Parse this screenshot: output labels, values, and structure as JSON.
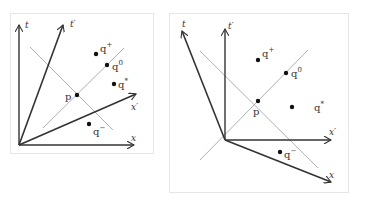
{
  "figure": {
    "panels": [
      {
        "id": "left",
        "axes": {
          "t": {
            "label": "t"
          },
          "t_prime": {
            "label": "t′"
          },
          "x": {
            "label": "x"
          },
          "x_prime": {
            "label": "x′"
          }
        },
        "points": {
          "p": {
            "label": "p"
          },
          "q_plus": {
            "base": "q",
            "sup": "+"
          },
          "q_zero": {
            "base": "q",
            "sup": "0"
          },
          "q_star": {
            "base": "q",
            "sup": "*"
          },
          "q_minus": {
            "base": "q",
            "sup": "−"
          }
        }
      },
      {
        "id": "right",
        "axes": {
          "t": {
            "label": "t"
          },
          "t_prime": {
            "label": "t′"
          },
          "x": {
            "label": "x"
          },
          "x_prime": {
            "label": "x′"
          }
        },
        "points": {
          "p": {
            "label": "p"
          },
          "q_plus": {
            "base": "q",
            "sup": "+"
          },
          "q_zero": {
            "base": "q",
            "sup": "0"
          },
          "q_star": {
            "base": "q",
            "sup": "*"
          },
          "q_minus": {
            "base": "q",
            "sup": "−"
          }
        }
      }
    ],
    "colors": {
      "axis": "#333333",
      "lightcone": "#9a9a9a",
      "point": "#111111",
      "frame": "#e6e6e6"
    }
  }
}
